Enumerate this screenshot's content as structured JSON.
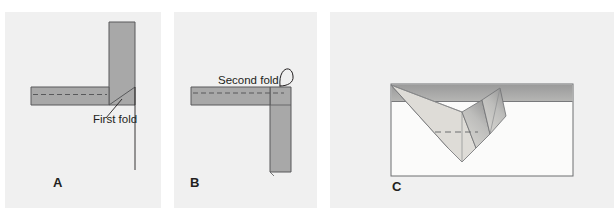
{
  "figure": {
    "background_color": "#ffffff",
    "panel_background_color": "#f0f0f0",
    "fabric_fill_color": "#a8a8a8",
    "fabric_stroke_color": "#58595b",
    "line_color": "#231f20",
    "width": 614,
    "height": 208
  },
  "panels": [
    {
      "id": "A",
      "label": "A",
      "callout": "First fold",
      "has_dashed_stitch_line": true,
      "has_pointer_line": true,
      "has_tail_line": true
    },
    {
      "id": "B",
      "label": "B",
      "callout": "Second fold",
      "has_dashed_stitch_line": true,
      "has_curved_arrow": true,
      "has_tail_line": false
    },
    {
      "id": "C",
      "label": "C",
      "callout": "",
      "has_dashed_stitch_line": true,
      "has_v_fold": true,
      "has_outer_rectangle": true
    }
  ]
}
